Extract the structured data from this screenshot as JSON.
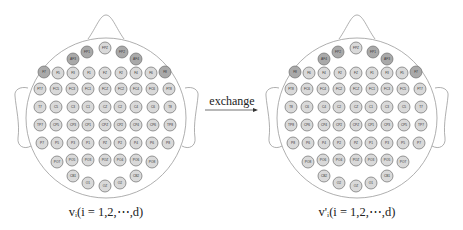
{
  "figure": {
    "arrow_label": "exchange",
    "colors": {
      "outline": "#9a9a9a",
      "electrode_dark": "#a9a9a9",
      "electrode_light": "#d9d9d9",
      "electrode_stroke": "#6e6e6e",
      "text": "#222222"
    }
  },
  "heads": [
    {
      "id": "original",
      "caption": "vᵢ(i = 1,2,⋯,d)",
      "cx": 105,
      "electrodes": [
        {
          "label": "FP1",
          "x": -18,
          "y": 52,
          "shade": "dark"
        },
        {
          "label": "FPZ",
          "x": 0,
          "y": 48,
          "shade": "light"
        },
        {
          "label": "FP2",
          "x": 17,
          "y": 52,
          "shade": "dark"
        },
        {
          "label": "AF3",
          "x": -32,
          "y": 59,
          "shade": "dark"
        },
        {
          "label": "AF4",
          "x": 31,
          "y": 59,
          "shade": "dark"
        },
        {
          "label": "F7",
          "x": -61,
          "y": 72,
          "shade": "dark"
        },
        {
          "label": "F5",
          "x": -47,
          "y": 73,
          "shade": "light"
        },
        {
          "label": "F3",
          "x": -32,
          "y": 73,
          "shade": "light"
        },
        {
          "label": "F1",
          "x": -16,
          "y": 73,
          "shade": "light"
        },
        {
          "label": "FZ",
          "x": 0,
          "y": 73,
          "shade": "light"
        },
        {
          "label": "F2",
          "x": 16,
          "y": 73,
          "shade": "light"
        },
        {
          "label": "F4",
          "x": 31,
          "y": 73,
          "shade": "light"
        },
        {
          "label": "F6",
          "x": 46,
          "y": 73,
          "shade": "light"
        },
        {
          "label": "F8",
          "x": 60,
          "y": 72,
          "shade": "dark"
        },
        {
          "label": "FT7",
          "x": -65,
          "y": 89,
          "shade": "light"
        },
        {
          "label": "FC5",
          "x": -49,
          "y": 89,
          "shade": "light"
        },
        {
          "label": "FC3",
          "x": -33,
          "y": 89,
          "shade": "light"
        },
        {
          "label": "FC1",
          "x": -17,
          "y": 89,
          "shade": "light"
        },
        {
          "label": "FCZ",
          "x": 0,
          "y": 89,
          "shade": "light"
        },
        {
          "label": "FC2",
          "x": 16,
          "y": 89,
          "shade": "light"
        },
        {
          "label": "FC4",
          "x": 31,
          "y": 89,
          "shade": "light"
        },
        {
          "label": "FC6",
          "x": 47,
          "y": 89,
          "shade": "light"
        },
        {
          "label": "FT8",
          "x": 64,
          "y": 89,
          "shade": "light"
        },
        {
          "label": "T7",
          "x": -65,
          "y": 107,
          "shade": "light"
        },
        {
          "label": "C5",
          "x": -49,
          "y": 107,
          "shade": "light"
        },
        {
          "label": "C3",
          "x": -32,
          "y": 107,
          "shade": "light"
        },
        {
          "label": "C1",
          "x": -17,
          "y": 107,
          "shade": "light"
        },
        {
          "label": "CZ",
          "x": 0,
          "y": 107,
          "shade": "light"
        },
        {
          "label": "C2",
          "x": 15,
          "y": 107,
          "shade": "light"
        },
        {
          "label": "C4",
          "x": 31,
          "y": 107,
          "shade": "light"
        },
        {
          "label": "C6",
          "x": 48,
          "y": 107,
          "shade": "light"
        },
        {
          "label": "T8",
          "x": 65,
          "y": 107,
          "shade": "light"
        },
        {
          "label": "TP7",
          "x": -65,
          "y": 125,
          "shade": "light"
        },
        {
          "label": "CP5",
          "x": -49,
          "y": 125,
          "shade": "light"
        },
        {
          "label": "CP3",
          "x": -32,
          "y": 125,
          "shade": "light"
        },
        {
          "label": "CP1",
          "x": -17,
          "y": 125,
          "shade": "light"
        },
        {
          "label": "CPZ",
          "x": 0,
          "y": 125,
          "shade": "light"
        },
        {
          "label": "CP2",
          "x": 15,
          "y": 125,
          "shade": "light"
        },
        {
          "label": "CP4",
          "x": 31,
          "y": 125,
          "shade": "light"
        },
        {
          "label": "CP6",
          "x": 48,
          "y": 125,
          "shade": "light"
        },
        {
          "label": "TP8",
          "x": 65,
          "y": 125,
          "shade": "light"
        },
        {
          "label": "P7",
          "x": -63,
          "y": 143,
          "shade": "light"
        },
        {
          "label": "P5",
          "x": -48,
          "y": 143,
          "shade": "light"
        },
        {
          "label": "P3",
          "x": -32,
          "y": 143,
          "shade": "light"
        },
        {
          "label": "P1",
          "x": -17,
          "y": 143,
          "shade": "light"
        },
        {
          "label": "PZ",
          "x": 0,
          "y": 143,
          "shade": "light"
        },
        {
          "label": "P2",
          "x": 15,
          "y": 143,
          "shade": "light"
        },
        {
          "label": "P4",
          "x": 31,
          "y": 143,
          "shade": "light"
        },
        {
          "label": "P6",
          "x": 47,
          "y": 143,
          "shade": "light"
        },
        {
          "label": "P8",
          "x": 63,
          "y": 143,
          "shade": "light"
        },
        {
          "label": "PO7",
          "x": -48,
          "y": 162,
          "shade": "light"
        },
        {
          "label": "PO5",
          "x": -33,
          "y": 160,
          "shade": "light"
        },
        {
          "label": "PO3",
          "x": -17,
          "y": 160,
          "shade": "light"
        },
        {
          "label": "POZ",
          "x": 0,
          "y": 160,
          "shade": "light"
        },
        {
          "label": "PO4",
          "x": 15,
          "y": 160,
          "shade": "light"
        },
        {
          "label": "PO6",
          "x": 31,
          "y": 160,
          "shade": "light"
        },
        {
          "label": "PO8",
          "x": 47,
          "y": 162,
          "shade": "light"
        },
        {
          "label": "CB1",
          "x": -32,
          "y": 176,
          "shade": "light"
        },
        {
          "label": "O1",
          "x": -17,
          "y": 183,
          "shade": "light"
        },
        {
          "label": "OZ",
          "x": 0,
          "y": 186,
          "shade": "light"
        },
        {
          "label": "O2",
          "x": 15,
          "y": 183,
          "shade": "light"
        },
        {
          "label": "CB2",
          "x": 31,
          "y": 176,
          "shade": "light"
        }
      ]
    },
    {
      "id": "exchanged",
      "caption": "v'ᵢ(i = 1,2,⋯,d)",
      "cx": 356,
      "electrodes": [
        {
          "label": "FP2",
          "x": -18,
          "y": 52,
          "shade": "dark"
        },
        {
          "label": "FPZ",
          "x": 0,
          "y": 48,
          "shade": "light"
        },
        {
          "label": "FP1",
          "x": 17,
          "y": 52,
          "shade": "dark"
        },
        {
          "label": "AF4",
          "x": -32,
          "y": 59,
          "shade": "dark"
        },
        {
          "label": "AF3",
          "x": 31,
          "y": 59,
          "shade": "dark"
        },
        {
          "label": "F8",
          "x": -61,
          "y": 72,
          "shade": "dark"
        },
        {
          "label": "F6",
          "x": -47,
          "y": 73,
          "shade": "light"
        },
        {
          "label": "F4",
          "x": -32,
          "y": 73,
          "shade": "light"
        },
        {
          "label": "F2",
          "x": -16,
          "y": 73,
          "shade": "light"
        },
        {
          "label": "FZ",
          "x": 0,
          "y": 73,
          "shade": "light"
        },
        {
          "label": "F1",
          "x": 16,
          "y": 73,
          "shade": "light"
        },
        {
          "label": "F3",
          "x": 31,
          "y": 73,
          "shade": "light"
        },
        {
          "label": "F5",
          "x": 46,
          "y": 73,
          "shade": "light"
        },
        {
          "label": "F7",
          "x": 60,
          "y": 72,
          "shade": "dark"
        },
        {
          "label": "FT8",
          "x": -65,
          "y": 89,
          "shade": "light"
        },
        {
          "label": "FC6",
          "x": -49,
          "y": 89,
          "shade": "light"
        },
        {
          "label": "FC4",
          "x": -33,
          "y": 89,
          "shade": "light"
        },
        {
          "label": "FC2",
          "x": -17,
          "y": 89,
          "shade": "light"
        },
        {
          "label": "FCZ",
          "x": 0,
          "y": 89,
          "shade": "light"
        },
        {
          "label": "FC1",
          "x": 16,
          "y": 89,
          "shade": "light"
        },
        {
          "label": "FC3",
          "x": 31,
          "y": 89,
          "shade": "light"
        },
        {
          "label": "FC5",
          "x": 47,
          "y": 89,
          "shade": "light"
        },
        {
          "label": "FT7",
          "x": 64,
          "y": 89,
          "shade": "light"
        },
        {
          "label": "T8",
          "x": -65,
          "y": 107,
          "shade": "light"
        },
        {
          "label": "C6",
          "x": -49,
          "y": 107,
          "shade": "light"
        },
        {
          "label": "C4",
          "x": -32,
          "y": 107,
          "shade": "light"
        },
        {
          "label": "C2",
          "x": -17,
          "y": 107,
          "shade": "light"
        },
        {
          "label": "CZ",
          "x": 0,
          "y": 107,
          "shade": "light"
        },
        {
          "label": "C1",
          "x": 15,
          "y": 107,
          "shade": "light"
        },
        {
          "label": "C3",
          "x": 31,
          "y": 107,
          "shade": "light"
        },
        {
          "label": "C5",
          "x": 48,
          "y": 107,
          "shade": "light"
        },
        {
          "label": "T7",
          "x": 65,
          "y": 107,
          "shade": "light"
        },
        {
          "label": "TP8",
          "x": -65,
          "y": 125,
          "shade": "light"
        },
        {
          "label": "CP6",
          "x": -49,
          "y": 125,
          "shade": "light"
        },
        {
          "label": "CP4",
          "x": -32,
          "y": 125,
          "shade": "light"
        },
        {
          "label": "CP2",
          "x": -17,
          "y": 125,
          "shade": "light"
        },
        {
          "label": "CPZ",
          "x": 0,
          "y": 125,
          "shade": "light"
        },
        {
          "label": "CP1",
          "x": 15,
          "y": 125,
          "shade": "light"
        },
        {
          "label": "CP3",
          "x": 31,
          "y": 125,
          "shade": "light"
        },
        {
          "label": "CP5",
          "x": 48,
          "y": 125,
          "shade": "light"
        },
        {
          "label": "TP7",
          "x": 65,
          "y": 125,
          "shade": "light"
        },
        {
          "label": "P8",
          "x": -63,
          "y": 143,
          "shade": "light"
        },
        {
          "label": "P6",
          "x": -48,
          "y": 143,
          "shade": "light"
        },
        {
          "label": "P4",
          "x": -32,
          "y": 143,
          "shade": "light"
        },
        {
          "label": "P2",
          "x": -17,
          "y": 143,
          "shade": "light"
        },
        {
          "label": "PZ",
          "x": 0,
          "y": 143,
          "shade": "light"
        },
        {
          "label": "P1",
          "x": 15,
          "y": 143,
          "shade": "light"
        },
        {
          "label": "P3",
          "x": 31,
          "y": 143,
          "shade": "light"
        },
        {
          "label": "P5",
          "x": 47,
          "y": 143,
          "shade": "light"
        },
        {
          "label": "P7",
          "x": 63,
          "y": 143,
          "shade": "light"
        },
        {
          "label": "PO8",
          "x": -48,
          "y": 162,
          "shade": "light"
        },
        {
          "label": "PO6",
          "x": -33,
          "y": 160,
          "shade": "light"
        },
        {
          "label": "PO4",
          "x": -17,
          "y": 160,
          "shade": "light"
        },
        {
          "label": "POZ",
          "x": 0,
          "y": 160,
          "shade": "light"
        },
        {
          "label": "PO3",
          "x": 15,
          "y": 160,
          "shade": "light"
        },
        {
          "label": "PO5",
          "x": 31,
          "y": 160,
          "shade": "light"
        },
        {
          "label": "PO7",
          "x": 47,
          "y": 162,
          "shade": "light"
        },
        {
          "label": "CB2",
          "x": -32,
          "y": 176,
          "shade": "light"
        },
        {
          "label": "O2",
          "x": -17,
          "y": 183,
          "shade": "light"
        },
        {
          "label": "OZ",
          "x": 0,
          "y": 186,
          "shade": "light"
        },
        {
          "label": "O1",
          "x": 15,
          "y": 183,
          "shade": "light"
        },
        {
          "label": "CB1",
          "x": 31,
          "y": 176,
          "shade": "light"
        }
      ]
    }
  ]
}
